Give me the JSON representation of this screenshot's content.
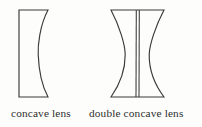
{
  "figure": {
    "background_color": "#fdfdfb",
    "stroke_color": "#3a3a3a",
    "caption_color": "#2e2e2e",
    "diagrams": [
      {
        "id": "concave-lens",
        "caption": "concave lens",
        "type": "plano-concave",
        "geometry": {
          "left_edge_x": 19,
          "right_edge_x": 48,
          "top_y": 10,
          "bottom_y": 97,
          "concave_apex_x": 38,
          "flat_side": "left",
          "curved_side": "right"
        }
      },
      {
        "id": "double-concave-lens",
        "caption": "double concave lens",
        "type": "bi-concave",
        "geometry": {
          "left_edge_x": 111,
          "right_edge_x": 164,
          "top_y": 10,
          "bottom_y": 97,
          "left_apex_x": 125,
          "right_apex_x": 149,
          "center_line_left_x": 136,
          "center_line_right_x": 139,
          "flat_side": "none",
          "curved_side": "both"
        }
      }
    ]
  }
}
